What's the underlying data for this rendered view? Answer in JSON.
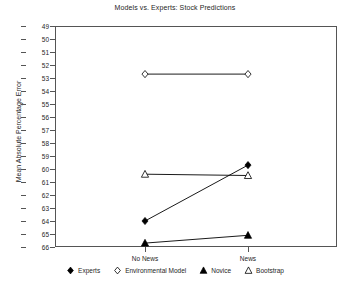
{
  "chart_data": {
    "type": "line",
    "title": "Models vs. Experts: Stock Predictions",
    "xlabel": "",
    "ylabel": "Mean Absolute Percentage Error",
    "categories": [
      "No News",
      "News"
    ],
    "ylim": [
      49,
      66
    ],
    "y_inverted": true,
    "yticks": [
      49,
      50,
      51,
      52,
      53,
      54,
      55,
      56,
      57,
      58,
      59,
      60,
      61,
      62,
      63,
      64,
      65,
      66
    ],
    "grid": false,
    "legend_position": "bottom",
    "series": [
      {
        "name": "Experts",
        "marker": "filled-diamond",
        "color": "#000000",
        "values": [
          64.0,
          59.7
        ]
      },
      {
        "name": "Environmental Model",
        "marker": "open-diamond",
        "color": "#000000",
        "values": [
          52.7,
          52.7
        ]
      },
      {
        "name": "Novice",
        "marker": "filled-triangle",
        "color": "#000000",
        "values": [
          65.7,
          65.1
        ]
      },
      {
        "name": "Bootstrap",
        "marker": "open-triangle",
        "color": "#000000",
        "values": [
          60.4,
          60.5
        ]
      }
    ]
  },
  "legend": {
    "items": [
      {
        "label": "Experts",
        "marker": "filled-diamond"
      },
      {
        "label": "Environmental Model",
        "marker": "open-diamond"
      },
      {
        "label": "Novice",
        "marker": "filled-triangle"
      },
      {
        "label": "Bootstrap",
        "marker": "open-triangle"
      }
    ]
  },
  "colors": {
    "axis": "#555555",
    "text": "#262626",
    "series": "#000000",
    "background": "#ffffff"
  }
}
